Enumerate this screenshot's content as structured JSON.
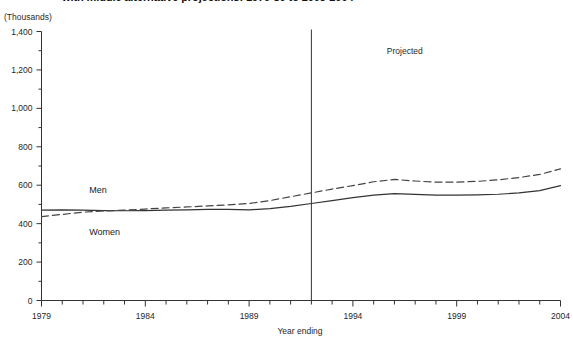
{
  "chart_data": {
    "type": "line",
    "title": "with middle alternative projections: 1979-80 to 2003-2004",
    "units_label": "(Thousands)",
    "xlabel": "Year ending",
    "ylabel": "",
    "xlim": [
      1979,
      2004
    ],
    "ylim": [
      0,
      1400
    ],
    "ytick_step": 200,
    "yminor_step": 100,
    "xtick_step": 1,
    "xlabel_step": 5,
    "grid": false,
    "legend_position": "inline-left",
    "ytick_labels": [
      "0",
      "200",
      "400",
      "600",
      "800",
      "1,000",
      "1,200",
      "1,400"
    ],
    "ytick_values": [
      0,
      200,
      400,
      600,
      800,
      1000,
      1200,
      1400
    ],
    "xtick_labels": [
      "1979",
      "1984",
      "1989",
      "1994",
      "1999",
      "2004"
    ],
    "xtick_values": [
      1979,
      1984,
      1989,
      1994,
      1999,
      2004
    ],
    "x": [
      1979,
      1980,
      1981,
      1982,
      1983,
      1984,
      1985,
      1986,
      1987,
      1988,
      1989,
      1990,
      1991,
      1992,
      1993,
      1994,
      1995,
      1996,
      1997,
      1998,
      1999,
      2000,
      2001,
      2002,
      2003,
      2004
    ],
    "series": [
      {
        "name": "Men",
        "style": "solid",
        "color": "#333333",
        "values": [
          470,
          472,
          470,
          468,
          467,
          468,
          470,
          472,
          474,
          474,
          472,
          478,
          490,
          505,
          520,
          535,
          548,
          556,
          552,
          548,
          548,
          550,
          553,
          560,
          572,
          598
        ]
      },
      {
        "name": "Women",
        "style": "dashed",
        "color": "#444444",
        "values": [
          437,
          448,
          460,
          466,
          470,
          476,
          482,
          487,
          492,
          498,
          505,
          520,
          540,
          560,
          580,
          598,
          618,
          630,
          622,
          616,
          616,
          620,
          628,
          640,
          656,
          685
        ]
      }
    ],
    "annotations": [
      {
        "text": "Projected",
        "x": 1996.5,
        "y": 1285
      }
    ],
    "divider": {
      "x": 1992,
      "label": "projection-start"
    },
    "series_labels": [
      {
        "text": "Men",
        "x": 1981.3,
        "y": 560
      },
      {
        "text": "Women",
        "x": 1981.3,
        "y": 340
      }
    ]
  }
}
